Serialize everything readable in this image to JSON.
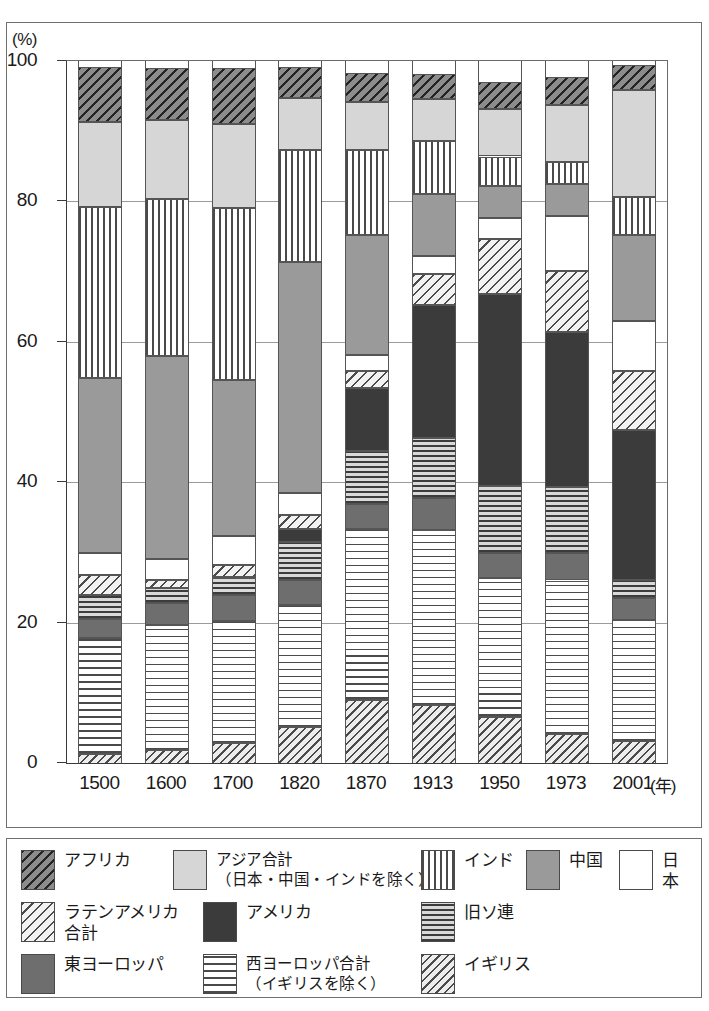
{
  "axis": {
    "y_unit": "(%)",
    "y_ticks": [
      "100",
      "80",
      "60",
      "40",
      "20",
      "0"
    ],
    "y_tick_values": [
      100,
      80,
      60,
      40,
      20,
      0
    ],
    "x_unit": "(年)",
    "x_ticks": [
      "1500",
      "1600",
      "1700",
      "1820",
      "1870",
      "1913",
      "1950",
      "1973",
      "2001"
    ]
  },
  "legend": {
    "items": [
      {
        "key": "africa",
        "label": "アフリカ",
        "pattern": "diagonal-hatch-dark",
        "color": "#8c8c8c"
      },
      {
        "key": "asia",
        "label": "アジア合計\n（日本・中国・インドを除く）",
        "pattern": "solid-light",
        "color": "#d6d6d6"
      },
      {
        "key": "india",
        "label": "インド",
        "pattern": "vertical-stripes",
        "color": "#ffffff"
      },
      {
        "key": "china",
        "label": "中国",
        "pattern": "solid-mid-gray",
        "color": "#9a9a9a"
      },
      {
        "key": "japan",
        "label": "日本",
        "pattern": "solid-white",
        "color": "#ffffff"
      },
      {
        "key": "latin",
        "label": "ラテンアメリカ\n合計",
        "pattern": "diagonal-hatch-light",
        "color": "#f2f2f2"
      },
      {
        "key": "usa",
        "label": "アメリカ",
        "pattern": "solid-near-black",
        "color": "#3b3b3b"
      },
      {
        "key": "ussr",
        "label": "旧ソ連",
        "pattern": "horizontal-stripes-dense",
        "color": "#c9c9c9"
      },
      {
        "key": "eeurope",
        "label": "東ヨーロッパ",
        "pattern": "solid-dark-gray",
        "color": "#6e6e6e"
      },
      {
        "key": "weurope",
        "label": "西ヨーロッパ合計\n（イギリスを除く）",
        "pattern": "horizontal-stripes",
        "color": "#ffffff"
      },
      {
        "key": "uk",
        "label": "イギリス",
        "pattern": "diagonal-hatch-fine",
        "color": "#ededed"
      }
    ]
  },
  "chart_data": {
    "type": "bar",
    "stacked": true,
    "title": "",
    "xlabel": "(年)",
    "ylabel": "(%)",
    "ylim": [
      0,
      100
    ],
    "grid": true,
    "legend_position": "bottom",
    "categories": [
      "1500",
      "1600",
      "1700",
      "1820",
      "1870",
      "1913",
      "1950",
      "1973",
      "2001"
    ],
    "stack_order_bottom_to_top": [
      "uk",
      "weurope",
      "eeurope",
      "ussr",
      "usa",
      "latin",
      "japan",
      "china",
      "india",
      "asia",
      "africa"
    ],
    "series": [
      {
        "name": "イギリス",
        "key": "uk",
        "values": [
          1.3,
          1.8,
          2.8,
          5.2,
          9.0,
          8.3,
          6.5,
          4.2,
          3.2
        ]
      },
      {
        "name": "西ヨーロッパ合計",
        "key": "weurope",
        "values": [
          16.5,
          17.8,
          17.5,
          17.3,
          24.3,
          24.9,
          19.9,
          21.8,
          17.2
        ]
      },
      {
        "name": "東ヨーロッパ",
        "key": "eeurope",
        "values": [
          2.7,
          3.2,
          3.6,
          3.6,
          3.6,
          4.5,
          3.5,
          3.9,
          3.1
        ]
      },
      {
        "name": "旧ソ連",
        "key": "ussr",
        "values": [
          3.4,
          2.2,
          2.5,
          5.4,
          7.6,
          8.6,
          9.6,
          9.4,
          2.6
        ]
      },
      {
        "name": "アメリカ",
        "key": "usa",
        "values": [
          0.0,
          0.0,
          0.1,
          1.8,
          8.9,
          18.9,
          27.3,
          22.1,
          21.4
        ]
      },
      {
        "name": "ラテンアメリカ合計",
        "key": "latin",
        "values": [
          2.9,
          1.1,
          1.7,
          2.1,
          2.4,
          4.4,
          7.8,
          8.7,
          8.3
        ]
      },
      {
        "name": "日本",
        "key": "japan",
        "values": [
          3.1,
          2.9,
          4.1,
          3.0,
          2.3,
          2.6,
          3.0,
          7.8,
          7.1
        ]
      },
      {
        "name": "中国",
        "key": "china",
        "values": [
          24.9,
          29.0,
          22.3,
          32.9,
          17.1,
          8.9,
          4.6,
          4.6,
          12.3
        ]
      },
      {
        "name": "インド",
        "key": "india",
        "values": [
          24.4,
          22.4,
          24.4,
          16.0,
          12.1,
          7.5,
          4.2,
          3.1,
          5.4
        ]
      },
      {
        "name": "アジア合計",
        "key": "asia",
        "values": [
          12.1,
          11.2,
          12.0,
          7.4,
          6.9,
          6.0,
          6.8,
          8.2,
          15.3
        ]
      },
      {
        "name": "アフリカ",
        "key": "africa",
        "values": [
          7.8,
          7.4,
          8.0,
          4.5,
          4.1,
          3.6,
          3.8,
          3.9,
          3.5
        ]
      }
    ]
  }
}
